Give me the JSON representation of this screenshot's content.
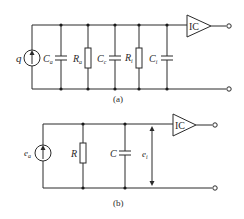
{
  "diagram_a": {
    "caption": "(a)",
    "source_label": "q",
    "components": [
      {
        "type": "capacitor",
        "label": "C",
        "sub": "a"
      },
      {
        "type": "resistor",
        "label": "R",
        "sub": "a"
      },
      {
        "type": "capacitor",
        "label": "C",
        "sub": "c"
      },
      {
        "type": "resistor",
        "label": "R",
        "sub": "i"
      },
      {
        "type": "capacitor",
        "label": "C",
        "sub": "i"
      }
    ],
    "amplifier_label": "IC"
  },
  "diagram_b": {
    "caption": "(b)",
    "source_label": "e",
    "source_sub": "a",
    "components": [
      {
        "type": "resistor",
        "label": "R"
      },
      {
        "type": "capacitor",
        "label": "C"
      }
    ],
    "voltage_label": "e",
    "voltage_sub": "i",
    "amplifier_label": "IC"
  }
}
